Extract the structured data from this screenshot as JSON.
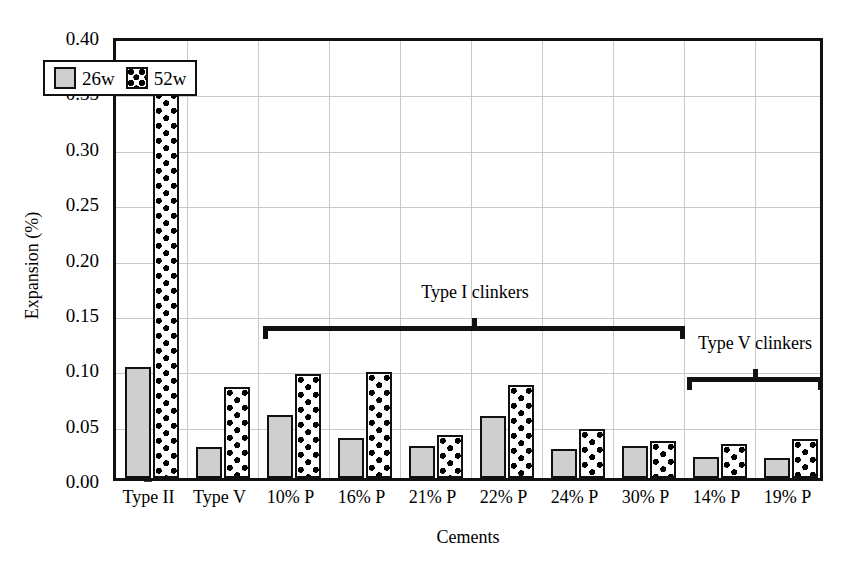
{
  "chart_data": {
    "type": "bar",
    "title": "",
    "xlabel": "Cements",
    "ylabel": "Expansion (%)",
    "ylim": [
      0.0,
      0.4
    ],
    "ytick_values": [
      0.0,
      0.05,
      0.1,
      0.15,
      0.2,
      0.25,
      0.3,
      0.35,
      0.4
    ],
    "ytick_labels": [
      "0.00",
      "0.05",
      "0.10",
      "0.15",
      "0.20",
      "0.25",
      "0.30",
      "0.35",
      "0.40"
    ],
    "grid": true,
    "legend_position": "upper left inside",
    "categories": [
      "Type II",
      "Type V",
      "10% P",
      "16% P",
      "21% P",
      "22% P",
      "24% P",
      "30% P",
      "14% P",
      "19% P"
    ],
    "series": [
      {
        "name": "26w",
        "color": "#cfcfcf",
        "pattern": "solid-gray",
        "values": [
          0.1,
          0.028,
          0.057,
          0.036,
          0.029,
          0.056,
          0.026,
          0.029,
          0.019,
          0.018
        ]
      },
      {
        "name": "52w",
        "color": "#ffffff",
        "pattern": "white-with-black-dots",
        "values": [
          0.35,
          0.082,
          0.094,
          0.096,
          0.039,
          0.084,
          0.044,
          0.033,
          0.031,
          0.035
        ]
      }
    ],
    "annotations": [
      {
        "label": "Type I clinkers",
        "type": "bracket",
        "spans_categories": [
          "10% P",
          "30% P"
        ]
      },
      {
        "label": "Type V clinkers",
        "type": "bracket",
        "spans_categories": [
          "14% P",
          "19% P"
        ]
      }
    ]
  },
  "legend": {
    "entries": [
      {
        "label": "26w",
        "swatch": "gray-solid-swatch"
      },
      {
        "label": "52w",
        "swatch": "dotted-swatch"
      }
    ]
  }
}
